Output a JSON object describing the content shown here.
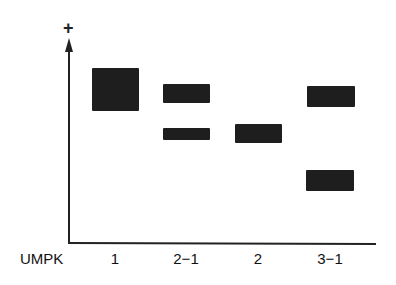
{
  "diagram": {
    "type": "gel-band-schematic",
    "axis_top_symbol": "+",
    "row_label": "UMPK",
    "lanes": [
      {
        "label": "1",
        "center_x": 115,
        "bands": [
          {
            "top": 68,
            "bottom": 111,
            "left": 92,
            "right": 139
          }
        ]
      },
      {
        "label": "2−1",
        "center_x": 186,
        "bands": [
          {
            "top": 84,
            "bottom": 103,
            "left": 163,
            "right": 210
          },
          {
            "top": 128,
            "bottom": 140,
            "left": 163,
            "right": 210
          }
        ]
      },
      {
        "label": "2",
        "center_x": 258,
        "bands": [
          {
            "top": 124,
            "bottom": 143,
            "left": 235,
            "right": 282
          }
        ]
      },
      {
        "label": "3−1",
        "center_x": 330,
        "bands": [
          {
            "top": 86,
            "bottom": 107,
            "left": 307,
            "right": 355
          },
          {
            "top": 170,
            "bottom": 191,
            "left": 306,
            "right": 354
          }
        ]
      }
    ],
    "band_color": "#1e1e1e"
  }
}
